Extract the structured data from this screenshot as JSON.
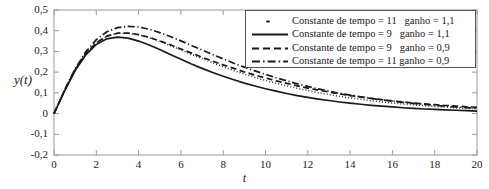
{
  "chart_data": {
    "type": "line",
    "title": "",
    "xlabel": "t",
    "ylabel": "y(t)",
    "xlim": [
      0,
      20
    ],
    "ylim": [
      -0.2,
      0.5
    ],
    "grid": false,
    "legend_position": "upper-right",
    "xticks": [
      "0",
      "2",
      "4",
      "6",
      "8",
      "10",
      "12",
      "14",
      "16",
      "18",
      "20"
    ],
    "xtick_values": [
      0,
      2,
      4,
      6,
      8,
      10,
      12,
      14,
      16,
      18,
      20
    ],
    "yticks": [
      "0,5",
      "0,4",
      "0,3",
      "0,2",
      "0,1",
      "0",
      "-0,1",
      "-0,2"
    ],
    "ytick_values": [
      0.5,
      0.4,
      0.3,
      0.2,
      0.1,
      0,
      -0.1,
      -0.2
    ],
    "x": [
      0,
      0.5,
      1,
      1.5,
      2,
      2.5,
      3,
      3.5,
      4,
      4.5,
      5,
      5.5,
      6,
      6.5,
      7,
      7.5,
      8,
      8.5,
      9,
      9.5,
      10,
      10.5,
      11,
      11.5,
      12,
      12.5,
      13,
      13.5,
      14,
      14.5,
      15,
      15.5,
      16,
      16.5,
      17,
      17.5,
      18,
      18.5,
      19,
      19.5,
      20
    ],
    "series": [
      {
        "name": "Constante de tempo = 11   ganho = 1,1",
        "linestyle": "dotted",
        "color": "#1a1a1a",
        "values": [
          0,
          0.112,
          0.212,
          0.289,
          0.342,
          0.373,
          0.387,
          0.388,
          0.38,
          0.366,
          0.348,
          0.328,
          0.307,
          0.286,
          0.265,
          0.245,
          0.226,
          0.208,
          0.191,
          0.175,
          0.16,
          0.146,
          0.134,
          0.122,
          0.111,
          0.101,
          0.092,
          0.083,
          0.076,
          0.069,
          0.062,
          0.056,
          0.051,
          0.046,
          0.042,
          0.038,
          0.034,
          0.031,
          0.028,
          0.025,
          0.023
        ]
      },
      {
        "name": "Constante de tempo = 9   ganho = 1,1",
        "linestyle": "solid",
        "color": "#1a1a1a",
        "values": [
          0,
          0.11,
          0.208,
          0.283,
          0.334,
          0.361,
          0.369,
          0.364,
          0.35,
          0.331,
          0.309,
          0.285,
          0.262,
          0.239,
          0.218,
          0.198,
          0.18,
          0.163,
          0.147,
          0.133,
          0.12,
          0.108,
          0.097,
          0.087,
          0.078,
          0.07,
          0.063,
          0.056,
          0.05,
          0.045,
          0.04,
          0.036,
          0.032,
          0.028,
          0.025,
          0.022,
          0.02,
          0.018,
          0.016,
          0.014,
          0.012
        ]
      },
      {
        "name": "Constante de tempo = 9   ganho = 0,9",
        "linestyle": "dashed",
        "color": "#1a1a1a",
        "values": [
          0,
          0.112,
          0.212,
          0.289,
          0.342,
          0.374,
          0.388,
          0.389,
          0.381,
          0.368,
          0.351,
          0.332,
          0.312,
          0.292,
          0.272,
          0.253,
          0.235,
          0.218,
          0.201,
          0.186,
          0.172,
          0.158,
          0.146,
          0.134,
          0.123,
          0.113,
          0.104,
          0.095,
          0.087,
          0.08,
          0.073,
          0.067,
          0.061,
          0.056,
          0.051,
          0.047,
          0.043,
          0.039,
          0.036,
          0.033,
          0.03
        ]
      },
      {
        "name": "Constante de tempo = 11 ganho = 0,9",
        "linestyle": "dashdot",
        "color": "#1a1a1a",
        "values": [
          0,
          0.113,
          0.216,
          0.298,
          0.357,
          0.395,
          0.415,
          0.421,
          0.418,
          0.407,
          0.391,
          0.372,
          0.351,
          0.329,
          0.307,
          0.285,
          0.264,
          0.243,
          0.224,
          0.206,
          0.189,
          0.173,
          0.158,
          0.144,
          0.131,
          0.119,
          0.108,
          0.098,
          0.089,
          0.081,
          0.073,
          0.066,
          0.06,
          0.054,
          0.049,
          0.044,
          0.04,
          0.036,
          0.032,
          0.029,
          0.026
        ]
      }
    ]
  },
  "axes": {
    "ylabel": "y(t)",
    "xlabel": "t"
  },
  "legend": {
    "entries": [
      {
        "label": "Constante de tempo = 11   ganho = 1,1",
        "style": "dotted"
      },
      {
        "label": "Constante de tempo = 9   ganho = 1,1",
        "style": "solid"
      },
      {
        "label": "Constante de tempo = 9   ganho = 0,9",
        "style": "dashed"
      },
      {
        "label": "Constante de tempo = 11 ganho = 0,9",
        "style": "dashdot"
      }
    ]
  },
  "colors": {
    "line": "#1a1a1a",
    "axis": "#888888",
    "legend_border": "#555555",
    "background": "#ffffff"
  }
}
